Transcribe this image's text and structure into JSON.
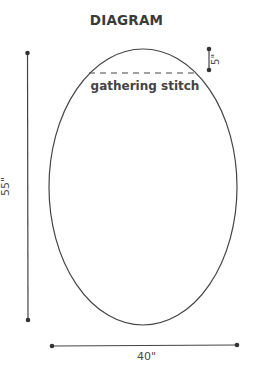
{
  "title": "DIAGRAM",
  "shape": {
    "type": "ellipse",
    "center": [
      143,
      187
    ],
    "rx": 94,
    "ry": 138,
    "stroke": "#444444"
  },
  "labels": {
    "gathering_stitch": "gathering stitch",
    "height": "55\"",
    "width": "40\"",
    "gap": "5\""
  },
  "dimensions": {
    "height_in": 55,
    "width_in": 40,
    "gathering_offset_in": 5
  },
  "colors": {
    "line": "#444444",
    "text": "#444444"
  }
}
